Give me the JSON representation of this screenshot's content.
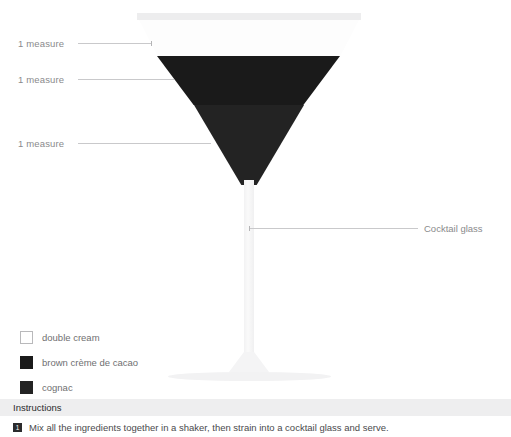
{
  "callouts": {
    "measures": [
      {
        "label": "1 measure"
      },
      {
        "label": "1 measure"
      },
      {
        "label": "1 measure"
      }
    ],
    "glass_label": "Cocktail glass"
  },
  "legend": {
    "items": [
      {
        "label": "double cream",
        "color": "#ffffff"
      },
      {
        "label": "brown crème de cacao",
        "color": "#1a1a1a"
      },
      {
        "label": "cognac",
        "color": "#232323"
      }
    ]
  },
  "instructions": {
    "title": "Instructions",
    "steps": [
      {
        "number": "1",
        "text": "Mix all the ingredients together in a shaker, then strain into a cocktail glass and serve."
      }
    ]
  },
  "diagram": {
    "glass_type": "Cocktail glass",
    "rim_color": "#ededee",
    "stem_color": "#f4f4f5",
    "layers": [
      {
        "name": "double cream",
        "color": "#fdfdfd",
        "measure": "1 measure"
      },
      {
        "name": "brown crème de cacao",
        "color": "#1a1a1a",
        "measure": "1 measure"
      },
      {
        "name": "cognac",
        "color": "#232323",
        "measure": "1 measure"
      }
    ]
  }
}
